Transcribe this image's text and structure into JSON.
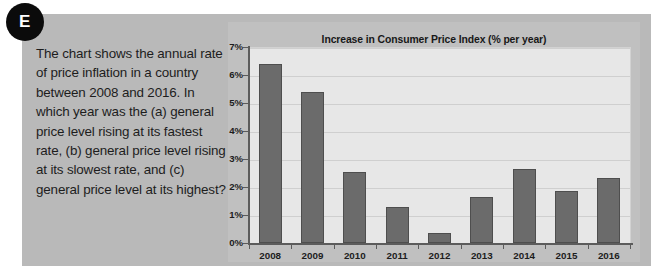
{
  "badge": {
    "label": "E"
  },
  "question": {
    "text": "The chart shows the annual rate of price inflation in a country between 2008 and 2016. In which year was the (a) general price level rising at its fastest rate, (b) general price level rising at its slowest rate, and (c) general price level at its highest?"
  },
  "colors": {
    "panel_background": "#b9b9b9",
    "chart_background": "#c0c0c0",
    "plot_background": "#e7e7e7",
    "bar_fill": "#6b6b6b",
    "bar_stroke": "#4e4e4e",
    "axis": "#5c5c5c",
    "gridline": "#cfcfcf",
    "text": "#1d1d1d",
    "badge_background": "#0b0b0b",
    "badge_text": "#ffffff"
  },
  "chart_data": {
    "type": "bar",
    "title": "Increase in Consumer Price Index (% per year)",
    "xlabel": "",
    "ylabel": "",
    "categories": [
      "2008",
      "2009",
      "2010",
      "2011",
      "2012",
      "2013",
      "2014",
      "2015",
      "2016"
    ],
    "values": [
      6.4,
      5.4,
      2.55,
      1.27,
      0.35,
      1.65,
      2.65,
      1.85,
      2.32
    ],
    "ylim": [
      0,
      7
    ],
    "ytick_values": [
      0,
      1,
      2,
      3,
      4,
      5,
      6,
      7
    ],
    "ytick_labels": [
      "0%",
      "1%",
      "2%",
      "3%",
      "4%",
      "5%",
      "6%",
      "7%"
    ],
    "grid": true,
    "legend": false,
    "units": "% per year"
  }
}
